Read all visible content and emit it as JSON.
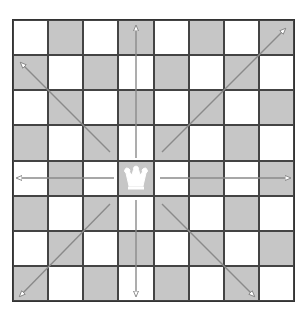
{
  "diagram": {
    "type": "chessboard",
    "files": 8,
    "ranks": 8,
    "top_left_square": "light",
    "colors": {
      "light": "#ffffff",
      "dark": "#c6c6c6",
      "grid": "#444444",
      "arrow": "#8a8a8a"
    },
    "piece": {
      "name": "queen",
      "color": "white",
      "square": "d4",
      "glyph": "♕"
    },
    "arrows": [
      {
        "direction": "up",
        "to": "d8"
      },
      {
        "direction": "down",
        "to": "d1"
      },
      {
        "direction": "left",
        "to": "a4"
      },
      {
        "direction": "right",
        "to": "h4"
      },
      {
        "direction": "up-left",
        "to": "a7"
      },
      {
        "direction": "up-right",
        "to": "h8"
      },
      {
        "direction": "down-left",
        "to": "a1"
      },
      {
        "direction": "down-right",
        "to": "g1"
      }
    ]
  }
}
